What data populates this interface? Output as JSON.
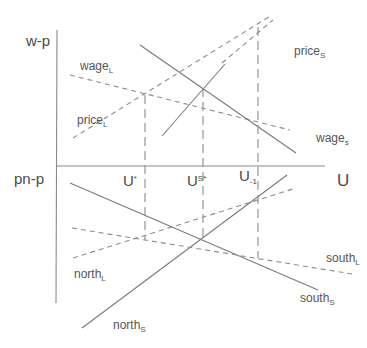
{
  "axes": {
    "upper_y_label": "w-p",
    "lower_y_label": "pn-p",
    "x_label": "U"
  },
  "u_markers": [
    {
      "base": "U",
      "sup": "*",
      "sub": ""
    },
    {
      "base": "U",
      "sup": "S*",
      "sub": ""
    },
    {
      "base": "U",
      "sup": "",
      "sub": "-1"
    }
  ],
  "curves": {
    "wage_L": {
      "base": "wage",
      "sub": "L",
      "style": "dashed"
    },
    "price_L": {
      "base": "price",
      "sub": "L",
      "style": "dashed"
    },
    "price_S": {
      "base": "price",
      "sub": "S",
      "style": "solid"
    },
    "wage_S": {
      "base": "wage",
      "sub": "s",
      "style": "solid"
    },
    "north_L": {
      "base": "north",
      "sub": "L",
      "style": "dashed"
    },
    "north_S": {
      "base": "north",
      "sub": "S",
      "style": "solid"
    },
    "south_L": {
      "base": "south",
      "sub": "L",
      "style": "dashed"
    },
    "south_S": {
      "base": "south",
      "sub": "S",
      "style": "solid"
    }
  },
  "colors": {
    "line": "#7a7a7a",
    "text": "#555555",
    "background": "#ffffff"
  }
}
